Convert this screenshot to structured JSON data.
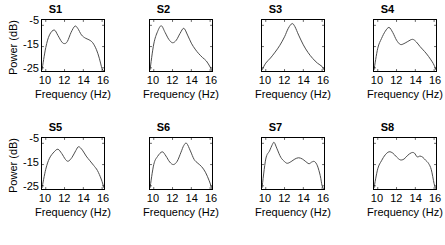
{
  "figure": {
    "n_rows": 2,
    "n_cols": 4,
    "line_color": "#4d4d4d",
    "frame_color": "#000000",
    "background": "#ffffff"
  },
  "axes": {
    "xlabel": "Frequency (Hz)",
    "ylabel": "Power (dB)",
    "xticks": [
      "10",
      "12",
      "14",
      "16"
    ],
    "yticks": [
      "-5",
      "-15",
      "-25"
    ],
    "xlim": [
      9.6,
      16.2
    ],
    "ylim": [
      -26.5,
      -2.5
    ]
  },
  "chart_data": {
    "type": "line",
    "title": "",
    "xlabel": "Frequency (Hz)",
    "ylabel": "Power (dB)",
    "xlim": [
      9.6,
      16.2
    ],
    "ylim": [
      -26.5,
      -2.5
    ],
    "xticks": [
      10,
      12,
      14,
      16
    ],
    "yticks": [
      -5,
      -15,
      -25
    ],
    "grid": false,
    "legend": "none",
    "subplot_titles": [
      "S1",
      "S2",
      "S3",
      "S4",
      "S5",
      "S6",
      "S7",
      "S8"
    ],
    "series": [
      {
        "name": "S1",
        "x": [
          9.6,
          10.0,
          10.4,
          10.9,
          11.3,
          11.7,
          12.0,
          12.3,
          12.7,
          13.1,
          13.4,
          13.8,
          14.2,
          14.6,
          15.0,
          15.4,
          15.7,
          16.0,
          16.2
        ],
        "values": [
          -26.0,
          -15.5,
          -9.5,
          -7.2,
          -9.8,
          -12.8,
          -13.6,
          -12.6,
          -8.3,
          -5.4,
          -6.4,
          -9.5,
          -11.0,
          -11.8,
          -13.2,
          -16.5,
          -20.5,
          -25.5,
          -26.5
        ]
      },
      {
        "name": "S2",
        "x": [
          9.6,
          10.0,
          10.4,
          10.8,
          11.2,
          11.6,
          12.0,
          12.4,
          12.8,
          13.2,
          13.6,
          14.0,
          14.4,
          14.8,
          15.2,
          15.6,
          16.0,
          16.2
        ],
        "values": [
          -26.0,
          -13.8,
          -8.0,
          -5.2,
          -8.3,
          -11.6,
          -13.2,
          -12.0,
          -8.8,
          -6.4,
          -9.6,
          -13.4,
          -16.2,
          -18.4,
          -20.2,
          -21.8,
          -24.6,
          -26.5
        ]
      },
      {
        "name": "S3",
        "x": [
          9.6,
          10.0,
          10.5,
          11.0,
          11.5,
          12.0,
          12.4,
          12.8,
          13.1,
          13.5,
          14.0,
          14.5,
          15.0,
          15.5,
          16.0,
          16.2
        ],
        "values": [
          -26.0,
          -22.8,
          -20.4,
          -17.6,
          -14.4,
          -10.4,
          -6.4,
          -4.2,
          -5.6,
          -9.6,
          -14.2,
          -17.8,
          -20.6,
          -22.8,
          -24.4,
          -26.0
        ]
      },
      {
        "name": "S4",
        "x": [
          9.6,
          10.0,
          10.4,
          10.8,
          11.2,
          11.6,
          12.0,
          12.4,
          12.8,
          13.2,
          13.7,
          14.1,
          14.5,
          15.0,
          15.4,
          15.8,
          16.0,
          16.2
        ],
        "values": [
          -26.0,
          -15.8,
          -11.2,
          -7.8,
          -6.0,
          -8.4,
          -12.0,
          -14.0,
          -13.6,
          -12.6,
          -11.6,
          -12.8,
          -15.0,
          -17.4,
          -19.6,
          -22.2,
          -23.8,
          -26.0
        ]
      },
      {
        "name": "S5",
        "x": [
          9.6,
          10.0,
          10.4,
          10.9,
          11.3,
          11.7,
          12.1,
          12.4,
          12.8,
          13.2,
          13.5,
          13.9,
          14.3,
          14.7,
          15.1,
          15.5,
          15.9,
          16.2
        ],
        "values": [
          -26.0,
          -17.2,
          -12.0,
          -9.0,
          -7.8,
          -9.8,
          -12.6,
          -13.4,
          -11.6,
          -8.4,
          -6.6,
          -8.2,
          -11.0,
          -13.2,
          -15.4,
          -17.8,
          -21.8,
          -26.0
        ]
      },
      {
        "name": "S6",
        "x": [
          9.6,
          10.0,
          10.4,
          10.9,
          11.3,
          11.7,
          12.1,
          12.5,
          12.9,
          13.2,
          13.5,
          13.9,
          14.3,
          14.7,
          15.1,
          15.5,
          15.9,
          16.2
        ],
        "values": [
          -26.0,
          -15.0,
          -11.2,
          -9.0,
          -11.0,
          -13.8,
          -15.0,
          -13.4,
          -9.2,
          -6.0,
          -5.0,
          -8.6,
          -12.6,
          -14.4,
          -16.0,
          -18.6,
          -22.6,
          -26.5
        ]
      },
      {
        "name": "S7",
        "x": [
          9.6,
          10.0,
          10.4,
          10.7,
          10.9,
          11.2,
          11.6,
          12.0,
          12.3,
          12.7,
          13.1,
          13.5,
          13.9,
          14.2,
          14.6,
          14.9,
          15.2,
          15.5,
          15.8,
          16.0,
          16.2
        ],
        "values": [
          -26.0,
          -12.4,
          -8.6,
          -5.6,
          -4.6,
          -7.6,
          -11.6,
          -13.6,
          -14.4,
          -13.6,
          -12.4,
          -11.8,
          -12.4,
          -13.4,
          -14.6,
          -13.8,
          -13.6,
          -15.6,
          -20.2,
          -25.0,
          -26.5
        ]
      },
      {
        "name": "S8",
        "x": [
          9.6,
          10.0,
          10.4,
          10.8,
          11.2,
          11.6,
          12.0,
          12.4,
          12.8,
          13.2,
          13.6,
          13.9,
          14.2,
          14.5,
          14.8,
          15.1,
          15.4,
          15.7,
          16.0,
          16.2
        ],
        "values": [
          -26.0,
          -17.0,
          -13.2,
          -10.4,
          -9.0,
          -9.6,
          -11.4,
          -12.8,
          -12.4,
          -10.6,
          -9.4,
          -9.6,
          -11.4,
          -11.0,
          -11.6,
          -13.0,
          -14.4,
          -17.4,
          -24.0,
          -26.5
        ]
      }
    ]
  }
}
